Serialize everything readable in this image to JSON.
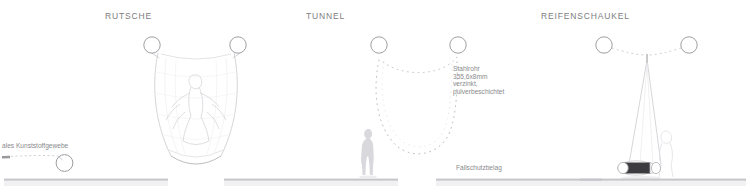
{
  "sheet": {
    "background": "#ffffff",
    "line_color": "#b9b9bd",
    "faint_color": "#d8d8dc",
    "text_color": "#7d7d80",
    "ground_color": "#d2d2d6",
    "tire_color": "#3c3c40"
  },
  "panels": [
    {
      "id": "panel-left-partial",
      "title": "",
      "note": "ales Kunststoffgewebe",
      "note_x": 2,
      "note_y": 142,
      "ground": {
        "x": 4,
        "y": 179,
        "width": 164
      }
    },
    {
      "id": "panel-rutsche",
      "title": "RUTSCHE",
      "title_x": 105,
      "title_y": 11,
      "ground": {
        "x": 224,
        "y": 180,
        "width": 174
      }
    },
    {
      "id": "panel-tunnel",
      "title": "TUNNEL",
      "title_x": 306,
      "title_y": 11,
      "note_block": "Stahlrohr\n355,6x8mm\nverzinkt,\npulverbeschichtet",
      "note_block_x": 453,
      "note_block_y": 65,
      "note_ground": "Fallschutzbelag",
      "note_ground_x": 456,
      "note_ground_y": 164,
      "ground": {
        "x": 436,
        "y": 180,
        "width": 166
      }
    },
    {
      "id": "panel-reifenschaukel",
      "title": "REIFENSCHAUKEL",
      "title_x": 541,
      "title_y": 11,
      "ground": {
        "x": 580,
        "y": 180,
        "width": 166
      }
    }
  ],
  "elements": {
    "ring_label": "steel-tube-section",
    "rope_label": "dotted-rope",
    "figure_label": "human-silhouette",
    "tire_label": "tire-swing-seat",
    "net_label": "funnel-net"
  },
  "icons": {
    "ring": "circle-icon",
    "rope": "dotted-line-icon",
    "person": "person-silhouette-icon",
    "tire": "tire-icon"
  }
}
